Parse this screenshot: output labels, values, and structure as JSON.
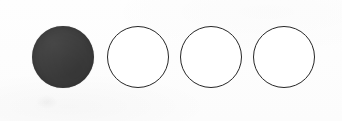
{
  "canvas": {
    "width": 342,
    "height": 121,
    "background_color": "#fdfdfd"
  },
  "widget": {
    "name": "circle-rating-scale",
    "total_count": 4,
    "selected_count": 1,
    "selected_index": 0,
    "value_label": "1 of 4",
    "fill_color": "#3d3d3d",
    "outline_color": "#262626",
    "empty_fill_color": "#ffffff"
  },
  "circles": [
    {
      "index": 1,
      "state": "filled",
      "cx": 63,
      "cy": 57,
      "diameter": 62,
      "fill": "#3d3d3d",
      "stroke": "#3d3d3d"
    },
    {
      "index": 2,
      "state": "empty",
      "cx": 138,
      "cy": 57,
      "diameter": 62,
      "fill": "#ffffff",
      "stroke": "#262626"
    },
    {
      "index": 3,
      "state": "empty",
      "cx": 211,
      "cy": 57,
      "diameter": 62,
      "fill": "#ffffff",
      "stroke": "#262626"
    },
    {
      "index": 4,
      "state": "empty",
      "cx": 284,
      "cy": 57,
      "diameter": 62,
      "fill": "#ffffff",
      "stroke": "#262626"
    }
  ],
  "artifact": {
    "name": "scan-shadow",
    "x": 36,
    "y": 95,
    "width": 22,
    "height": 14
  }
}
